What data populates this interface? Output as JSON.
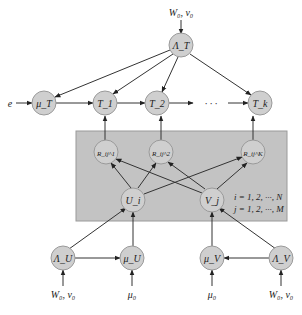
{
  "diagram": {
    "nodes": {
      "lambda_t": "Λ_T",
      "mu_t": "μ_T",
      "t1": "T_1",
      "t2": "T_2",
      "tk": "T_k",
      "r1": "R_ij^1",
      "r2": "R_ij^2",
      "rk": "R_ij^K",
      "u": "U_i",
      "v": "V_j",
      "lambda_u": "Λ_U",
      "mu_u": "μ_U",
      "mu_v": "μ_V",
      "lambda_v": "Λ_V"
    },
    "labels": {
      "top_prior": "W₀, ν₀",
      "e": "e",
      "ellipsis": "· · ·",
      "index_i": "i = 1, 2, ···, N",
      "index_j": "j = 1, 2, ···, M",
      "prior_lambda_u": "W₀, ν₀",
      "prior_mu_u": "μ₀",
      "prior_mu_v": "μ₀",
      "prior_lambda_v": "W₀, ν₀"
    }
  }
}
